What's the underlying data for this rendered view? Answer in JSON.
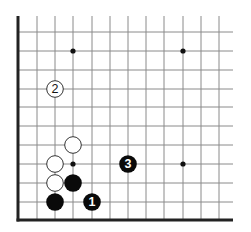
{
  "diagram": {
    "type": "go-board-corner",
    "corner": "bottom-left",
    "colors": {
      "background": "#ffffff",
      "grid_line": "#8a8a8a",
      "edge_line": "#222222",
      "black_stone": "#0a0a0a",
      "white_stone_fill": "#ffffff",
      "white_stone_stroke": "#333333",
      "star_point": "#111111"
    },
    "grid": {
      "columns_x": [
        18,
        37,
        55,
        73,
        92,
        110,
        128,
        146,
        164,
        183,
        201,
        219
      ],
      "rows_y": [
        32,
        51,
        70,
        89,
        107,
        126,
        145,
        164,
        183,
        202,
        220
      ],
      "top_extent": 16,
      "right_extent": 233,
      "left_edge_x": 18,
      "bottom_edge_y": 220
    },
    "star_points": [
      {
        "x": 73,
        "y": 51
      },
      {
        "x": 183,
        "y": 51
      },
      {
        "x": 73,
        "y": 164
      },
      {
        "x": 183,
        "y": 164
      }
    ],
    "stones": [
      {
        "color": "white",
        "x": 73,
        "y": 145,
        "label": ""
      },
      {
        "color": "white",
        "x": 55,
        "y": 164,
        "label": ""
      },
      {
        "color": "white",
        "x": 55,
        "y": 183,
        "label": ""
      },
      {
        "color": "black",
        "x": 73,
        "y": 183,
        "label": ""
      },
      {
        "color": "black",
        "x": 55,
        "y": 202,
        "label": ""
      },
      {
        "color": "black",
        "x": 92,
        "y": 202,
        "label": "1"
      },
      {
        "color": "white",
        "x": 55,
        "y": 89,
        "label": "2"
      },
      {
        "color": "black",
        "x": 128,
        "y": 164,
        "label": "3"
      }
    ]
  }
}
